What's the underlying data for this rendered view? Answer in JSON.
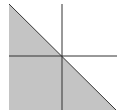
{
  "diagram": {
    "type": "half-plane-shading",
    "colors": {
      "background": "#ffffff",
      "shade": "#c4c4c4",
      "boundary": "#333333",
      "axes": "#333333"
    },
    "shaded_region": {
      "points": "9,4 116,110 9,110"
    },
    "boundary_line": {
      "x1": 9,
      "y1": 4,
      "x2": 116,
      "y2": 110
    },
    "x_axis": {
      "x1": 9,
      "y1": 56,
      "x2": 117,
      "y2": 56
    },
    "y_axis": {
      "x1": 62,
      "y1": 4,
      "x2": 62,
      "y2": 110
    }
  }
}
